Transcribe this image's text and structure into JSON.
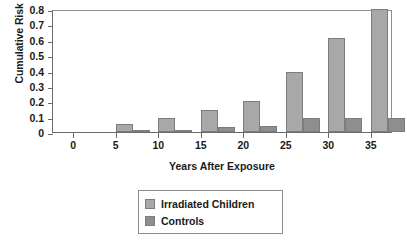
{
  "chart_data": {
    "type": "bar",
    "title": "",
    "xlabel": "Years After Exposure",
    "ylabel": "Cumulative Risk (%)",
    "categories": [
      "0",
      "5",
      "10",
      "15",
      "20",
      "25",
      "30",
      "35"
    ],
    "x": [
      0,
      5,
      10,
      15,
      20,
      25,
      30,
      35
    ],
    "series": [
      {
        "name": "Irradiated Children",
        "color": "#a8a8a8",
        "values": [
          0,
          0.05,
          0.09,
          0.14,
          0.2,
          0.39,
          0.61,
          0.8
        ]
      },
      {
        "name": "Controls",
        "color": "#8e8e8e",
        "values": [
          0,
          0.005,
          0.015,
          0.03,
          0.04,
          0.09,
          0.09,
          0.09
        ]
      }
    ],
    "ylim": [
      0,
      0.8
    ],
    "yticks": [
      "0",
      "0.1",
      "0.2",
      "0.3",
      "0.4",
      "0.5",
      "0.6",
      "0.7",
      "0.8"
    ],
    "ytick_values": [
      0,
      0.1,
      0.2,
      0.3,
      0.4,
      0.5,
      0.6,
      0.7,
      0.8
    ],
    "xlim": [
      -2.5,
      37.5
    ],
    "grid": false,
    "legend_position": "bottom-center"
  },
  "legend": {
    "items": [
      {
        "label": "Irradiated Children"
      },
      {
        "label": "Controls"
      }
    ]
  }
}
